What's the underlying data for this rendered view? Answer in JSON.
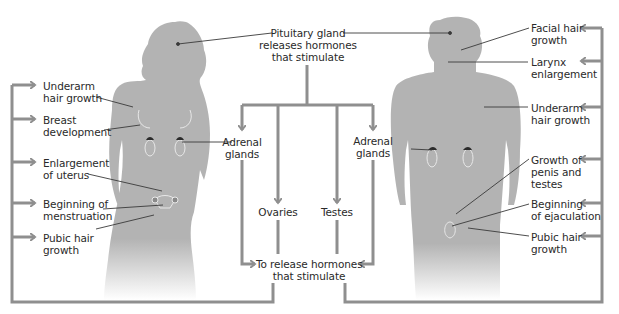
{
  "colors": {
    "silhouette": "#b3b3b3",
    "arrow": "#8f8f8f",
    "leader_line": "#3a3a3a",
    "text": "#2a2a2a",
    "organ_outline": "#e8e8e8",
    "gland": "#2b2b2b"
  },
  "center": {
    "pituitary": [
      "Pituitary gland",
      "releases hormones",
      "that stimulate"
    ],
    "adrenal_left": [
      "Adrenal",
      "glands"
    ],
    "adrenal_right": [
      "Adrenal",
      "glands"
    ],
    "ovaries": "Ovaries",
    "testes": "Testes",
    "release": [
      "To release hormones",
      "that stimulate"
    ]
  },
  "female": {
    "figure": "female-silhouette",
    "effects": [
      {
        "line1": "Underarm",
        "line2": "hair growth"
      },
      {
        "line1": "Breast",
        "line2": "development"
      },
      {
        "line1": "Enlargement",
        "line2": "of uterus"
      },
      {
        "line1": "Beginning of",
        "line2": "menstruation"
      },
      {
        "line1": "Pubic hair",
        "line2": "growth"
      }
    ]
  },
  "male": {
    "figure": "male-silhouette",
    "effects": [
      {
        "line1": "Facial hair",
        "line2": "growth"
      },
      {
        "line1": "Larynx",
        "line2": "enlargement"
      },
      {
        "line1": "Underarm",
        "line2": "hair growth"
      },
      {
        "line1": "Growth of",
        "line2": "penis and",
        "line3": "testes"
      },
      {
        "line1": "Beginning",
        "line2": "of ejaculation"
      },
      {
        "line1": "Pubic hair",
        "line2": "growth"
      }
    ]
  }
}
